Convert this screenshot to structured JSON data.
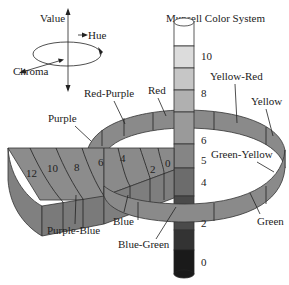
{
  "title": "Munsell Color System",
  "axes_legend": {
    "value": "Value",
    "hue": "Hue",
    "chroma": "Chroma"
  },
  "hues": {
    "red_purple": "Red-Purple",
    "red": "Red",
    "yellow_red": "Yellow-Red",
    "yellow": "Yellow",
    "purple": "Purple",
    "green_yellow": "Green-Yellow",
    "green": "Green",
    "blue_green": "Blue-Green",
    "blue": "Blue",
    "purple_blue": "Purple-Blue"
  },
  "value_scale": [
    "10",
    "8",
    "6",
    "5",
    "4",
    "2",
    "0"
  ],
  "chroma_scale": [
    "12",
    "10",
    "8",
    "6",
    "4",
    "2",
    "0"
  ],
  "colors": {
    "ring": "#8a8a8a",
    "stroke": "#333333",
    "value_10": "#ffffff",
    "value_9": "#e0e0e0",
    "value_8": "#c8c8c8",
    "value_7": "#b0b0b0",
    "value_6": "#9a9a9a",
    "value_5": "#858585",
    "value_4": "#6e6e6e",
    "value_3": "#555555",
    "value_2": "#3c3c3c",
    "value_1": "#262626",
    "value_0": "#111111"
  }
}
